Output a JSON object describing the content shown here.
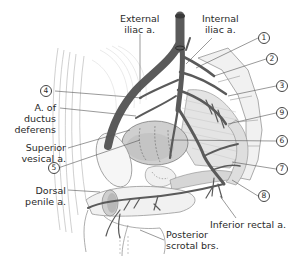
{
  "figure": {
    "colors": {
      "artery": "#5a5a5a",
      "artery_dark": "#3a3a3a",
      "leader": "#555555",
      "organ_fill": "#cfcfcf",
      "organ_shade": "#b5b5b5",
      "outline": "#8a8a8a",
      "hatching": "#bdbdbd"
    }
  },
  "labels": {
    "external_iliac": [
      "External",
      "iliac a."
    ],
    "internal_iliac": [
      "Internal",
      "iliac a."
    ],
    "ductus_deferens": [
      "A. of",
      "ductus",
      "deferens"
    ],
    "superior_vesical": [
      "Superior",
      "vesical a."
    ],
    "dorsal_penile": [
      "Dorsal",
      "penile a."
    ],
    "inferior_rectal": "Inferior rectal a.",
    "posterior_scrotal": [
      "Posterior",
      "scrotal brs."
    ]
  },
  "numbers": {
    "n1": "1",
    "n2": "2",
    "n3": "3",
    "n4": "4",
    "n5": "5",
    "n6": "6",
    "n7": "7",
    "n8": "8",
    "n9": "9"
  }
}
